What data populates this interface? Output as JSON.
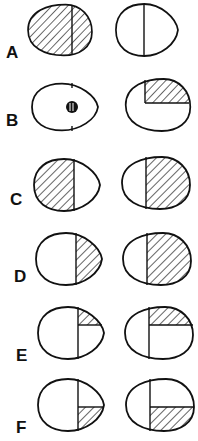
{
  "figure": {
    "type": "diagram",
    "rows": [
      {
        "label": "A",
        "left": {
          "hatch": "full",
          "divider": "vertical"
        },
        "right": {
          "hatch": "none",
          "divider": "vertical"
        }
      },
      {
        "label": "B",
        "left": {
          "hatch": "small-circle",
          "divider": "tick-marks"
        },
        "right": {
          "hatch": "upper-right-quadrant",
          "divider": "partial"
        }
      },
      {
        "label": "C",
        "left": {
          "hatch": "left-half",
          "divider": "vertical"
        },
        "right": {
          "hatch": "right-half",
          "divider": "vertical"
        }
      },
      {
        "label": "D",
        "left": {
          "hatch": "right-half",
          "divider": "vertical"
        },
        "right": {
          "hatch": "right-half",
          "divider": "vertical"
        }
      },
      {
        "label": "E",
        "left": {
          "hatch": "upper-right-quadrant",
          "divider": "quadrants"
        },
        "right": {
          "hatch": "upper-right-quadrant",
          "divider": "quadrants"
        }
      },
      {
        "label": "F",
        "left": {
          "hatch": "lower-right-quadrant",
          "divider": "quadrants"
        },
        "right": {
          "hatch": "lower-right-quadrant",
          "divider": "quadrants"
        }
      }
    ]
  },
  "labels": {
    "A": "A",
    "B": "B",
    "C": "C",
    "D": "D",
    "E": "E",
    "F": "F"
  }
}
